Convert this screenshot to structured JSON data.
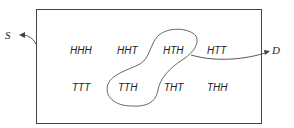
{
  "diagram": {
    "sample_space_label": "S",
    "event_label": "D",
    "outcomes": [
      {
        "label": "HHH",
        "row": 0,
        "col": 0,
        "in_event": false
      },
      {
        "label": "HHT",
        "row": 0,
        "col": 1,
        "in_event": false
      },
      {
        "label": "HTH",
        "row": 0,
        "col": 2,
        "in_event": true
      },
      {
        "label": "HTT",
        "row": 0,
        "col": 3,
        "in_event": false
      },
      {
        "label": "TTT",
        "row": 1,
        "col": 0,
        "in_event": false
      },
      {
        "label": "TTH",
        "row": 1,
        "col": 1,
        "in_event": true
      },
      {
        "label": "THT",
        "row": 1,
        "col": 2,
        "in_event": false
      },
      {
        "label": "THH",
        "row": 1,
        "col": 3,
        "in_event": false
      }
    ],
    "colors": {
      "line": "#444444",
      "text": "#222222"
    }
  }
}
